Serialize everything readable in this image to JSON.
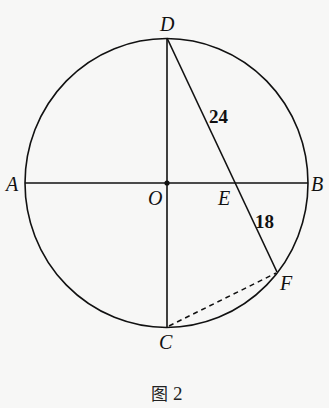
{
  "figure": {
    "caption_prefix": "图",
    "caption_number": "2",
    "circle": {
      "cx": 166.5,
      "cy": 183,
      "rx": 141.5,
      "ry": 144.5
    },
    "line_color": "#111111",
    "points": {
      "A": {
        "label": "A",
        "x": 25,
        "y": 183
      },
      "B": {
        "label": "B",
        "x": 308,
        "y": 183
      },
      "C": {
        "label": "C",
        "x": 167,
        "y": 327
      },
      "D": {
        "label": "D",
        "x": 167,
        "y": 38
      },
      "O": {
        "label": "O",
        "x": 167,
        "y": 183
      },
      "E": {
        "label": "E",
        "x": 236,
        "y": 183
      },
      "F": {
        "label": "F",
        "x": 277,
        "y": 272
      }
    },
    "segments": [
      {
        "from": "A",
        "to": "B",
        "style": "solid"
      },
      {
        "from": "D",
        "to": "C",
        "style": "solid"
      },
      {
        "from": "D",
        "to": "F",
        "style": "solid"
      },
      {
        "from": "C",
        "to": "F",
        "style": "dashed"
      }
    ],
    "lengths": {
      "DE": "24",
      "EF": "18"
    }
  }
}
